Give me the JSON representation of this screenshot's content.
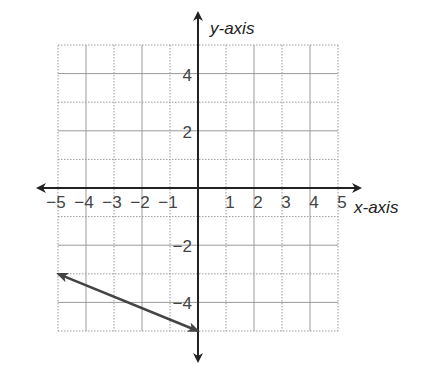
{
  "chart_data": {
    "type": "line",
    "title": "",
    "xlabel": "x-axis",
    "ylabel": "y-axis",
    "xlim": [
      -5,
      5
    ],
    "ylim": [
      -5,
      5
    ],
    "grid": true,
    "x_ticks": [
      -5,
      -4,
      -3,
      -2,
      -1,
      1,
      2,
      3,
      4,
      5
    ],
    "y_ticks": [
      4,
      2,
      -2,
      -4
    ],
    "x_tick_labels": [
      "−5",
      "−4",
      "−3",
      "−2",
      "−1",
      "1",
      "2",
      "3",
      "4",
      "5"
    ],
    "y_tick_labels": [
      "4",
      "2",
      "−2",
      "−4"
    ],
    "series": [
      {
        "name": "line",
        "x": [
          -5,
          0
        ],
        "y": [
          -3,
          -5
        ],
        "arrows": "both"
      }
    ]
  },
  "colors": {
    "grid": "#9a9a9a",
    "axis": "#222222",
    "line": "#444444"
  }
}
